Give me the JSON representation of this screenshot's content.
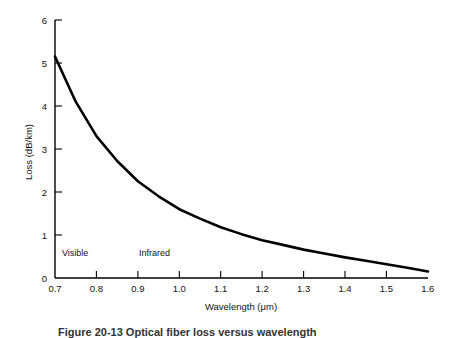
{
  "figure": {
    "background_color": "#ffffff",
    "curve_color": "#000000",
    "axis_color": "#000000",
    "caption": "Figure 20-13  Optical fiber loss versus wavelength"
  },
  "chart_data": {
    "type": "line",
    "title": "",
    "subtitle": "",
    "xlabel": "Wavelength (μm)",
    "ylabel": "Loss (dB/km)",
    "xlim": [
      0.7,
      1.6
    ],
    "ylim": [
      0,
      6
    ],
    "grid": false,
    "legend": null,
    "xticks": [
      0.7,
      0.8,
      0.9,
      1.0,
      1.1,
      1.2,
      1.3,
      1.4,
      1.5,
      1.6
    ],
    "xtick_labels": [
      "0.7",
      "0.8",
      "0.9",
      "1.0",
      "1.1",
      "1.2",
      "1.3",
      "1.4",
      "1.5",
      "1.6"
    ],
    "yticks": [
      0,
      1,
      2,
      3,
      4,
      5,
      6
    ],
    "ytick_labels": [
      "0",
      "1",
      "2",
      "3",
      "4",
      "5",
      "6"
    ],
    "series": [
      {
        "name": "Fiber attenuation",
        "x": [
          0.7,
          0.75,
          0.8,
          0.85,
          0.9,
          0.95,
          1.0,
          1.05,
          1.1,
          1.15,
          1.2,
          1.25,
          1.3,
          1.35,
          1.4,
          1.45,
          1.5,
          1.55,
          1.6
        ],
        "y": [
          5.15,
          4.1,
          3.3,
          2.72,
          2.25,
          1.9,
          1.6,
          1.38,
          1.18,
          1.02,
          0.88,
          0.77,
          0.66,
          0.57,
          0.48,
          0.4,
          0.32,
          0.24,
          0.15
        ]
      }
    ],
    "annotations": [
      {
        "text": "Visible",
        "x": 0.715,
        "y": 0.4
      },
      {
        "text": "Infrared",
        "x": 0.905,
        "y": 0.4
      }
    ]
  },
  "axis": {
    "x_title": "Wavelength (μm)",
    "y_title": "Loss (dB/km)"
  },
  "ticks": {
    "y": [
      "6",
      "5",
      "4",
      "3",
      "2",
      "1",
      "0"
    ],
    "x": [
      "0.7",
      "0.8",
      "0.9",
      "1.0",
      "1.1",
      "1.2",
      "1.3",
      "1.4",
      "1.5",
      "1.6"
    ]
  },
  "regions": {
    "visible": "Visible",
    "infrared": "Infrared"
  }
}
